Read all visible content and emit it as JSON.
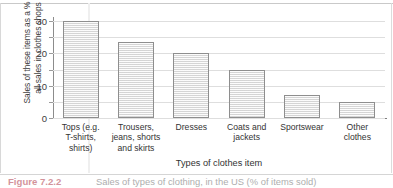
{
  "chart_data": {
    "type": "bar",
    "title": "",
    "xlabel": "Types of clothes item",
    "ylabel": "Sales of these items as a % of all sales in clothes shops",
    "ylabel_line1": "Sales of these items as a % of",
    "ylabel_line2": "all sales in clothes shops",
    "categories": [
      "Tops (e.g.\nT-shirts,\nshirts)",
      "Trousers,\njeans, shorts\nand skirts",
      "Dresses",
      "Coats and\njackets",
      "Sportswear",
      "Other\nclothes"
    ],
    "values": [
      30,
      23.5,
      20,
      15,
      7,
      5
    ],
    "ylim": [
      0,
      31
    ],
    "yticks": [
      0,
      5,
      10,
      15,
      20,
      25,
      30
    ],
    "ytick_labels": [
      "0",
      "",
      "10",
      "",
      "20",
      "",
      "30"
    ],
    "grid": true,
    "legend": "none",
    "bar_fill": "#e9e9e9",
    "bar_border": "#8e8e8e"
  },
  "caption": {
    "figure_number": "Figure 7.2.2",
    "text": "Sales of types of clothing, in the US (% of items sold)"
  }
}
